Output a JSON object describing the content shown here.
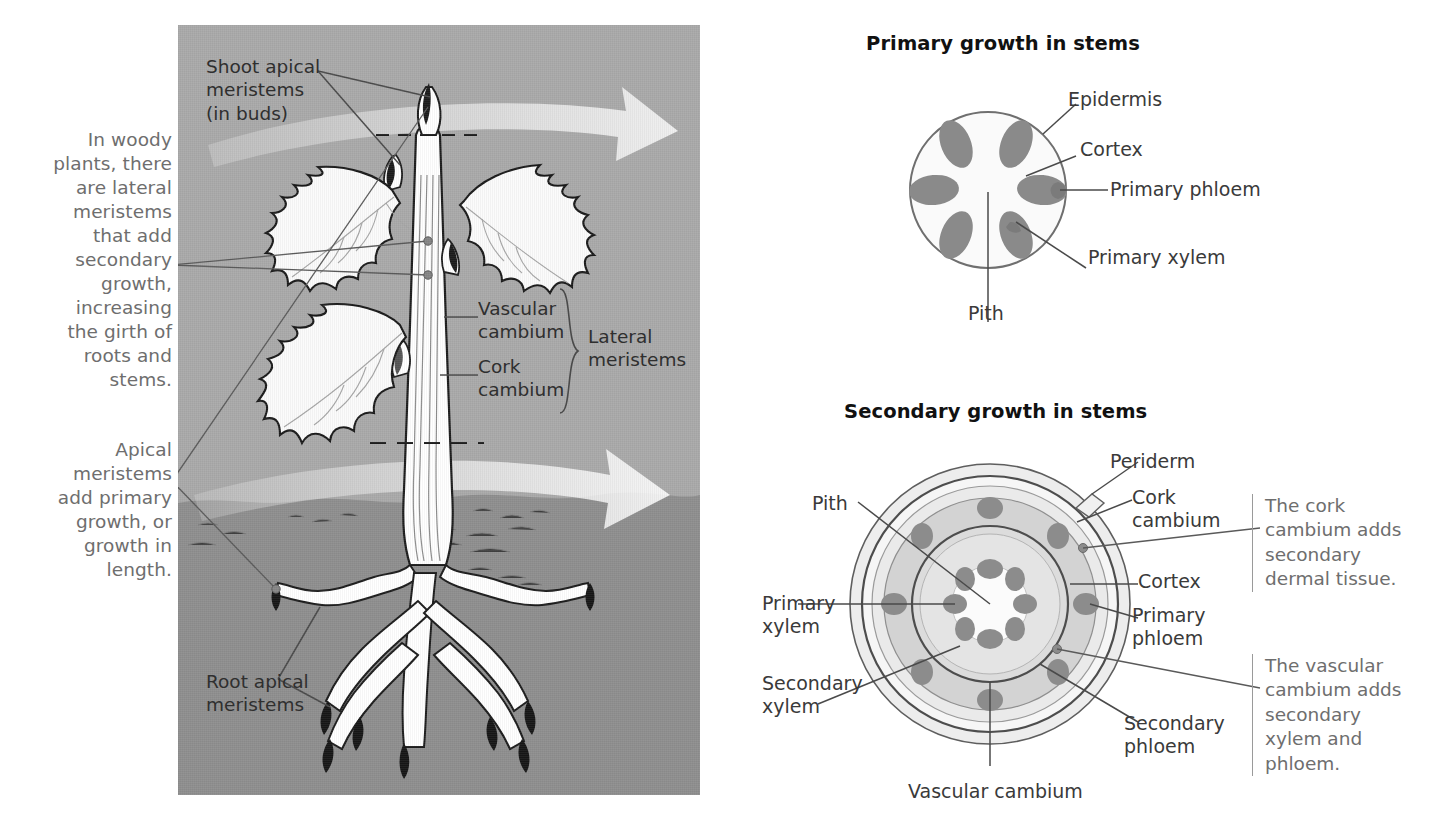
{
  "figure": {
    "left_notes": [
      {
        "id": "lateral-note",
        "text": "In woody\nplants, there\nare lateral\nmeristems\nthat add\nsecondary\ngrowth,\nincreasing\nthe girth of\nroots and\nstems."
      },
      {
        "id": "apical-note",
        "text": "Apical\nmeristems\nadd primary\ngrowth, or\ngrowth in\nlength."
      }
    ],
    "plant_panel": {
      "labels": [
        {
          "id": "shoot-apical-meristems",
          "text": "Shoot apical\nmeristems\n(in buds)"
        },
        {
          "id": "vascular-cambium",
          "text": "Vascular\ncambium"
        },
        {
          "id": "cork-cambium",
          "text": "Cork\ncambium"
        },
        {
          "id": "lateral-meristems",
          "text": "Lateral\nmeristems"
        },
        {
          "id": "root-apical-meristems",
          "text": "Root apical\nmeristems"
        }
      ]
    },
    "primary_growth": {
      "title": "Primary growth in stems",
      "labels": [
        {
          "id": "epidermis",
          "text": "Epidermis"
        },
        {
          "id": "cortex",
          "text": "Cortex"
        },
        {
          "id": "primary-phloem",
          "text": "Primary phloem"
        },
        {
          "id": "primary-xylem",
          "text": "Primary xylem"
        },
        {
          "id": "pith",
          "text": "Pith"
        }
      ]
    },
    "secondary_growth": {
      "title": "Secondary growth in stems",
      "labels": [
        {
          "id": "pith",
          "text": "Pith"
        },
        {
          "id": "primary-xylem",
          "text": "Primary\nxylem"
        },
        {
          "id": "secondary-xylem",
          "text": "Secondary\nxylem"
        },
        {
          "id": "vascular-cambium",
          "text": "Vascular cambium"
        },
        {
          "id": "periderm",
          "text": "Periderm"
        },
        {
          "id": "cork-cambium",
          "text": "Cork\ncambium"
        },
        {
          "id": "cortex",
          "text": "Cortex"
        },
        {
          "id": "primary-phloem",
          "text": "Primary\nphloem"
        },
        {
          "id": "secondary-phloem",
          "text": "Secondary\nphloem"
        }
      ],
      "callouts": [
        {
          "id": "cork-cambium-callout",
          "text": "The cork\ncambium adds\nsecondary\ndermal tissue."
        },
        {
          "id": "vascular-cambium-callout",
          "text": "The vascular\ncambium adds\nsecondary\nxylem and\nphloem."
        }
      ]
    },
    "colors": {
      "panel_background": "#a9a9a9",
      "soil": "#8e8e8e",
      "tissue_dark": "#8a8a8a",
      "ring_cortex": "#e2e2e2",
      "ring_secondary_phloem": "#c9c9c9",
      "ring_secondary_xylem": "#d9d9d9",
      "note_text": "#6e6e6e",
      "label_text": "#3a3a3a",
      "title_text": "#111111"
    }
  }
}
